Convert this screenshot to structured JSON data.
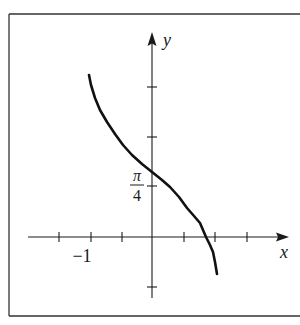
{
  "chart_data": {
    "type": "line",
    "title": "",
    "xlabel": "x",
    "ylabel": "y",
    "x_tick_step": 0.5,
    "x_ticks": [
      -1.5,
      -1,
      -0.5,
      0.5,
      1,
      1.5
    ],
    "x_tick_labels": [
      {
        "value": -1,
        "label": "−1"
      }
    ],
    "y_ticks_count_above": 3,
    "y_ticks_count_below": 1,
    "y_tick_labels": [
      {
        "tick_index": 1,
        "label_num": "π",
        "label_den": "4",
        "meaning": "pi/4"
      }
    ],
    "grid": false,
    "legend": null,
    "series": [
      {
        "name": "curve",
        "description": "Decreasing curve from (-1, top) through (0, slightly above pi/4), crossing x-axis near x=0.85, ending near x=1 below the axis",
        "points_px": [
          [
            89,
            75
          ],
          [
            91,
            85
          ],
          [
            95,
            98
          ],
          [
            100,
            110
          ],
          [
            107,
            122
          ],
          [
            115,
            134
          ],
          [
            123,
            145
          ],
          [
            132,
            155
          ],
          [
            142,
            164
          ],
          [
            152,
            172
          ],
          [
            162,
            180
          ],
          [
            170,
            187
          ],
          [
            179,
            197
          ],
          [
            187,
            208
          ],
          [
            194,
            216
          ],
          [
            200,
            223
          ],
          [
            206,
            237
          ],
          [
            210,
            245
          ],
          [
            213,
            252
          ],
          [
            215,
            262
          ],
          [
            217,
            274
          ]
        ]
      }
    ],
    "axes": {
      "origin_px": [
        152,
        237
      ],
      "x_axis": {
        "from_px": 28,
        "to_px": 288
      },
      "y_axis": {
        "from_px": 298,
        "to_px": 33
      },
      "x_tick_px": [
        59,
        91,
        122,
        184,
        215,
        247
      ],
      "y_tick_px": [
        87,
        137,
        186,
        287
      ]
    }
  },
  "labels": {
    "x_axis": "x",
    "y_axis": "y",
    "x_minus_one": "−1",
    "pi_numerator": "π",
    "pi_denominator": "4"
  },
  "colors": {
    "ink": "#1a1a1a",
    "frame": "#333333",
    "background": "#ffffff"
  }
}
